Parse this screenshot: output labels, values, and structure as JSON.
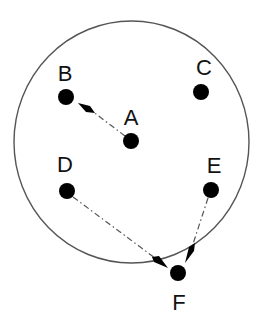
{
  "diagram": {
    "type": "node-graph",
    "boundary": {
      "shape": "circle",
      "cx": 131.5,
      "cy": 142,
      "rx": 117.5,
      "ry": 121,
      "stroke": "#555555"
    },
    "nodes": [
      {
        "id": "A",
        "label": "A",
        "x": 131,
        "y": 141,
        "label_x": 131,
        "label_y": 117,
        "inside_boundary": true
      },
      {
        "id": "B",
        "label": "B",
        "x": 66,
        "y": 97,
        "label_x": 65,
        "label_y": 73,
        "inside_boundary": true
      },
      {
        "id": "C",
        "label": "C",
        "x": 201,
        "y": 92,
        "label_x": 204,
        "label_y": 67,
        "inside_boundary": true
      },
      {
        "id": "D",
        "label": "D",
        "x": 67,
        "y": 191,
        "label_x": 65,
        "label_y": 164,
        "inside_boundary": true
      },
      {
        "id": "E",
        "label": "E",
        "x": 211,
        "y": 190,
        "label_x": 214,
        "label_y": 165,
        "inside_boundary": true
      },
      {
        "id": "F",
        "label": "F",
        "x": 178,
        "y": 273,
        "label_x": 179,
        "label_y": 302,
        "inside_boundary": false
      }
    ],
    "edges": [
      {
        "from": "A",
        "to": "B",
        "style": "dash-dot",
        "arrow": "end"
      },
      {
        "from": "D",
        "to": "F",
        "style": "dash-dot",
        "arrow": "end"
      },
      {
        "from": "E",
        "to": "F",
        "style": "dash-dot",
        "arrow": "end"
      }
    ],
    "colors": {
      "dot": "#000000",
      "line": "#555555",
      "label": "#111111"
    }
  }
}
